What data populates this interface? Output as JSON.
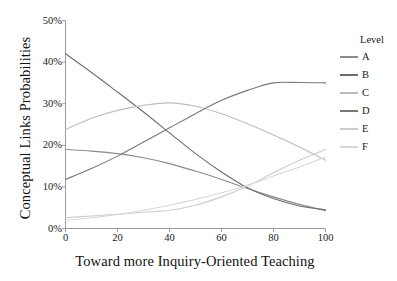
{
  "chart_data": {
    "type": "line",
    "title": "",
    "xlabel": "Toward more Inquiry-Oriented Teaching",
    "ylabel": "Conceptual Links Probabilities",
    "xlim": [
      0,
      100
    ],
    "ylim": [
      0,
      50
    ],
    "grid": false,
    "legend_position": "right",
    "legend_title": "Level",
    "xticks": [
      0,
      20,
      40,
      60,
      80,
      100
    ],
    "xticklabels": [
      "0",
      "20",
      "40",
      "60",
      "80",
      "100"
    ],
    "yticks": [
      0,
      10,
      20,
      30,
      40,
      50
    ],
    "yticklabels": [
      "0%",
      "10%",
      "20%",
      "30%",
      "40%",
      "50%"
    ],
    "x": [
      0,
      10,
      20,
      30,
      40,
      50,
      60,
      70,
      80,
      90,
      100
    ],
    "series": [
      {
        "name": "A",
        "color": "#8c8c8c",
        "values": [
          19.0,
          18.6,
          18.0,
          17.0,
          15.6,
          13.8,
          11.8,
          9.6,
          7.6,
          5.8,
          4.3
        ]
      },
      {
        "name": "B",
        "color": "#6e6e6e",
        "values": [
          42.0,
          37.5,
          32.8,
          28.0,
          23.0,
          18.0,
          13.6,
          9.8,
          7.2,
          5.4,
          4.5
        ]
      },
      {
        "name": "C",
        "color": "#bdbdbd",
        "values": [
          23.8,
          26.5,
          28.4,
          29.6,
          30.2,
          29.4,
          27.6,
          25.2,
          22.5,
          19.6,
          16.4
        ]
      },
      {
        "name": "D",
        "color": "#787878",
        "values": [
          11.8,
          14.4,
          17.4,
          20.8,
          24.2,
          27.6,
          30.8,
          33.2,
          35.0,
          35.1,
          35.0
        ]
      },
      {
        "name": "E",
        "color": "#cccccc",
        "values": [
          2.6,
          3.0,
          3.4,
          3.9,
          4.4,
          5.6,
          7.6,
          10.2,
          13.4,
          16.4,
          19.0
        ]
      },
      {
        "name": "F",
        "color": "#d8d8d8",
        "values": [
          2.0,
          2.6,
          3.4,
          4.4,
          5.6,
          7.0,
          8.6,
          10.4,
          12.6,
          14.8,
          17.2
        ]
      }
    ]
  },
  "legend": {
    "title": "Level",
    "items": [
      {
        "label": "A"
      },
      {
        "label": "B"
      },
      {
        "label": "C"
      },
      {
        "label": "D"
      },
      {
        "label": "E"
      },
      {
        "label": "F"
      }
    ]
  },
  "axes": {
    "y_title": "Conceptual Links Probabilities",
    "x_title": "Toward more Inquiry-Oriented Teaching"
  },
  "colors": {
    "axis": "#9a9a9a",
    "text": "#1a1a1a",
    "background": "#ffffff"
  }
}
